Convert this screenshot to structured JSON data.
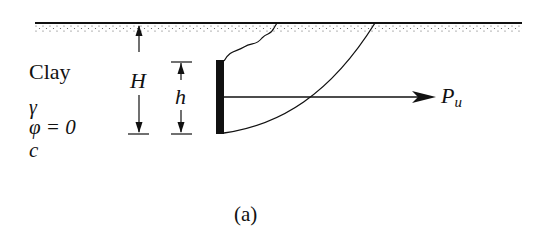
{
  "diagram": {
    "soil_labels": {
      "material": "Clay",
      "unit_weight": "γ",
      "friction_angle": "φ = 0",
      "cohesion": "c"
    },
    "dimensions": {
      "total_depth": "H",
      "anchor_height": "h"
    },
    "force": {
      "label_main": "P",
      "label_sub": "u"
    },
    "caption": "(a)",
    "colors": {
      "line": "#111111",
      "stipple": "#555555",
      "background": "#ffffff"
    }
  }
}
